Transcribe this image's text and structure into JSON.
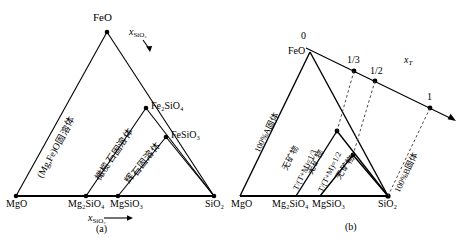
{
  "figure": {
    "title_a": "(a)",
    "title_b": "(b)"
  },
  "panel_a": {
    "caption": "(a)",
    "apex_label": "FeO",
    "base_labels": [
      "MgO",
      "Mg₂SiO₄",
      "MgSiO₃",
      "SiO₂"
    ],
    "interior_points": [
      "Fe₂SiO₄",
      "FeSiO₃"
    ],
    "axis_top_label": "x",
    "axis_top_sub": "SiO₂",
    "axis_bottom_label": "x",
    "axis_bottom_sub": "SiO₂",
    "region_labels": [
      "(Mg,Fe)O固溶体",
      "橄榄石固溶体",
      "辉石固溶体"
    ]
  },
  "panel_b": {
    "caption": "(b)",
    "apex_label": "FeO",
    "base_labels": [
      "MgO",
      "Mg₂SiO₄",
      "MgSiO₃",
      "SiO₂"
    ],
    "scale_axis_label": "x",
    "scale_axis_sub": "T",
    "scale_ticks": [
      "0",
      "1/3",
      "1/2",
      "1"
    ],
    "region_labels": [
      "100%A固体",
      "无矿物",
      "T/(T+M)=1/3",
      "无矿物",
      "T/(T+M)=1/2",
      "无矿物",
      "100%B固体"
    ]
  },
  "colors": {
    "stroke": "#000000",
    "background": "#ffffff",
    "dashed": "#555555"
  }
}
